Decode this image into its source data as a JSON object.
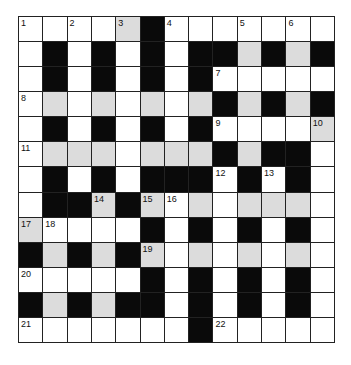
{
  "puzzle": {
    "type": "crossword",
    "rows": 13,
    "cols": 13,
    "colors": {
      "white": "#ffffff",
      "shaded": "#dcdcdc",
      "block": "#0a0a0a",
      "line": "#222222"
    },
    "grid": [
      "WWWWGBWWWWWWW",
      "WBWBWBWBBGBGB",
      "WBWBWBWBWWWWW",
      "WGWGWGWGBGBGB",
      "WBWBWBWBWWWWG",
      "WGGGWGGGBGBBW",
      "WBWBWBBBWBWBW",
      "WBBGBGWGWGGGW",
      "GWWWWBWBWBWBW",
      "BGBGBGWGWGWGW",
      "WWWWWBWBWBWBW",
      "BGBGBBWBWBWBW",
      "WWWWWWWBWWWWW"
    ],
    "numbers": [
      {
        "r": 0,
        "c": 0,
        "n": "1"
      },
      {
        "r": 0,
        "c": 2,
        "n": "2"
      },
      {
        "r": 0,
        "c": 4,
        "n": "3"
      },
      {
        "r": 0,
        "c": 6,
        "n": "4"
      },
      {
        "r": 0,
        "c": 9,
        "n": "5"
      },
      {
        "r": 0,
        "c": 11,
        "n": "6"
      },
      {
        "r": 2,
        "c": 8,
        "n": "7"
      },
      {
        "r": 3,
        "c": 0,
        "n": "8"
      },
      {
        "r": 4,
        "c": 8,
        "n": "9"
      },
      {
        "r": 4,
        "c": 12,
        "n": "10"
      },
      {
        "r": 5,
        "c": 0,
        "n": "11"
      },
      {
        "r": 6,
        "c": 8,
        "n": "12"
      },
      {
        "r": 6,
        "c": 10,
        "n": "13"
      },
      {
        "r": 7,
        "c": 3,
        "n": "14"
      },
      {
        "r": 7,
        "c": 5,
        "n": "15"
      },
      {
        "r": 7,
        "c": 6,
        "n": "16"
      },
      {
        "r": 8,
        "c": 0,
        "n": "17"
      },
      {
        "r": 8,
        "c": 1,
        "n": "18"
      },
      {
        "r": 9,
        "c": 5,
        "n": "19"
      },
      {
        "r": 10,
        "c": 0,
        "n": "20"
      },
      {
        "r": 12,
        "c": 0,
        "n": "21"
      },
      {
        "r": 12,
        "c": 8,
        "n": "22"
      }
    ]
  }
}
